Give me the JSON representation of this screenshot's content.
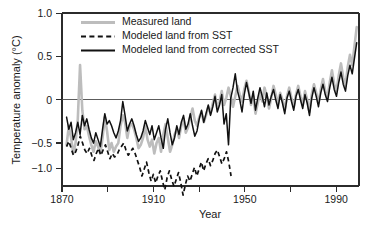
{
  "chart_data": {
    "type": "line",
    "title": "",
    "xlabel": "Year",
    "ylabel": "Temperature anomaly (°C)",
    "xlim": [
      1870,
      2000
    ],
    "ylim": [
      -1.25,
      1.0
    ],
    "grid": false,
    "legend_position": "top-left",
    "x_ticks_major": [
      1870,
      1910,
      1950,
      1990
    ],
    "x_ticks_minor": [
      1890,
      1930,
      1970
    ],
    "x_tick_labels": [
      "1870",
      "1910",
      "1950",
      "1990"
    ],
    "y_ticks": [
      1.0,
      0.5,
      0,
      -0.5,
      -1.0
    ],
    "y_tick_labels": [
      "1.0",
      "0.5",
      "0",
      "−0.5",
      "−1.0"
    ],
    "zero_reference_line": 0,
    "colors": {
      "measured": "#bdbdbd",
      "modeled_sst": "#111111",
      "modeled_corrected": "#111111",
      "axis": "#2b2b2b"
    },
    "series": [
      {
        "name": "Measured land",
        "style": "solid",
        "color": "#bdbdbd",
        "x_start": 1872,
        "x_end": 1999,
        "values": [
          -0.52,
          -0.3,
          -0.44,
          -0.62,
          -0.5,
          -0.22,
          0.4,
          -0.12,
          -0.34,
          -0.3,
          -0.42,
          -0.52,
          -0.6,
          -0.48,
          -0.54,
          -0.62,
          -0.44,
          -0.2,
          -0.36,
          -0.58,
          -0.5,
          -0.6,
          -0.54,
          -0.5,
          -0.3,
          -0.18,
          -0.26,
          -0.44,
          -0.3,
          -0.28,
          -0.34,
          -0.44,
          -0.56,
          -0.52,
          -0.44,
          -0.3,
          -0.46,
          -0.54,
          -0.46,
          -0.62,
          -0.5,
          -0.44,
          -0.6,
          -0.4,
          -0.28,
          -0.44,
          -0.6,
          -0.52,
          -0.4,
          -0.34,
          -0.44,
          -0.3,
          -0.22,
          -0.38,
          -0.32,
          -0.2,
          -0.1,
          -0.24,
          -0.3,
          -0.2,
          -0.14,
          -0.26,
          -0.18,
          -0.08,
          -0.16,
          -0.04,
          0.06,
          -0.1,
          -0.02,
          0.1,
          -0.06,
          0.02,
          0.14,
          0.04,
          -0.08,
          0.04,
          0.16,
          0.06,
          -0.02,
          0.12,
          0.22,
          0.1,
          -0.06,
          0.04,
          -0.16,
          -0.04,
          0.08,
          -0.02,
          0.14,
          0.04,
          -0.1,
          0.02,
          0.16,
          0.06,
          -0.04,
          0.08,
          0.0,
          -0.12,
          0.04,
          0.14,
          0.02,
          -0.08,
          0.06,
          0.16,
          0.04,
          -0.06,
          0.1,
          0.0,
          -0.14,
          0.06,
          0.18,
          0.08,
          -0.04,
          0.12,
          0.24,
          0.1,
          0.02,
          0.2,
          0.34,
          0.18,
          0.1,
          0.28,
          0.42,
          0.26,
          0.16,
          0.38,
          0.52,
          0.4,
          0.62,
          0.84
        ]
      },
      {
        "name": "Modeled land from SST",
        "style": "dashed",
        "color": "#111111",
        "x_start": 1872,
        "x_end": 1944,
        "values": [
          -0.54,
          -0.48,
          -0.56,
          -0.64,
          -0.6,
          -0.52,
          -0.42,
          -0.5,
          -0.58,
          -0.62,
          -0.56,
          -0.64,
          -0.7,
          -0.62,
          -0.56,
          -0.64,
          -0.58,
          -0.52,
          -0.6,
          -0.68,
          -0.62,
          -0.66,
          -0.64,
          -0.58,
          -0.54,
          -0.5,
          -0.58,
          -0.64,
          -0.6,
          -0.56,
          -0.62,
          -0.7,
          -0.78,
          -0.88,
          -0.8,
          -0.72,
          -0.84,
          -0.94,
          -0.86,
          -0.96,
          -0.88,
          -0.82,
          -0.94,
          -1.04,
          -0.9,
          -0.82,
          -0.92,
          -1.0,
          -0.92,
          -0.84,
          -0.96,
          -1.1,
          -0.98,
          -0.88,
          -0.94,
          -0.86,
          -0.78,
          -0.88,
          -0.8,
          -0.72,
          -0.82,
          -0.74,
          -0.68,
          -0.76,
          -0.7,
          -0.62,
          -0.58,
          -0.66,
          -0.74,
          -0.68,
          -0.6,
          -0.72,
          -0.88
        ]
      },
      {
        "name": "Modeled land from corrected SST",
        "style": "solid",
        "color": "#111111",
        "x_start": 1872,
        "x_end": 1999,
        "values": [
          -0.2,
          -0.34,
          -0.26,
          -0.46,
          -0.38,
          -0.26,
          -0.4,
          -0.18,
          -0.3,
          -0.22,
          -0.34,
          -0.44,
          -0.5,
          -0.38,
          -0.46,
          -0.54,
          -0.34,
          -0.16,
          -0.28,
          -0.24,
          -0.3,
          -0.38,
          -0.44,
          -0.36,
          -0.24,
          -0.02,
          -0.18,
          -0.36,
          -0.28,
          -0.22,
          -0.3,
          -0.4,
          -0.48,
          -0.44,
          -0.36,
          -0.24,
          -0.32,
          -0.4,
          -0.3,
          -0.46,
          -0.38,
          -0.3,
          -0.44,
          -0.56,
          -0.34,
          -0.22,
          -0.38,
          -0.52,
          -0.44,
          -0.3,
          -0.4,
          -0.26,
          -0.18,
          -0.34,
          -0.28,
          -0.16,
          -0.3,
          -0.42,
          -0.36,
          -0.22,
          -0.12,
          -0.26,
          -0.16,
          -0.06,
          -0.18,
          -0.08,
          0.04,
          -0.14,
          -0.06,
          0.06,
          -0.28,
          -0.16,
          -0.52,
          0.02,
          0.14,
          0.3,
          0.1,
          0.0,
          -0.14,
          0.06,
          0.2,
          0.08,
          -0.04,
          0.1,
          -0.12,
          0.02,
          0.14,
          0.04,
          -0.08,
          0.08,
          -0.06,
          0.04,
          0.12,
          0.0,
          -0.1,
          0.06,
          -0.04,
          -0.16,
          0.02,
          0.1,
          -0.02,
          -0.12,
          0.04,
          0.12,
          0.0,
          -0.1,
          0.06,
          -0.04,
          -0.18,
          0.02,
          0.14,
          0.04,
          -0.08,
          0.08,
          0.18,
          0.06,
          -0.02,
          0.14,
          0.26,
          0.12,
          0.04,
          0.2,
          0.32,
          0.18,
          0.1,
          0.28,
          0.4,
          0.3,
          0.48,
          0.66
        ]
      }
    ]
  },
  "legend": {
    "items": [
      {
        "label": "Measured land",
        "style": "solid-gray"
      },
      {
        "label": "Modeled land from SST",
        "style": "dashed-black"
      },
      {
        "label": "Modeled land from corrected SST",
        "style": "solid-black"
      }
    ]
  },
  "axes": {
    "x_title": "Year",
    "y_title": "Temperature anomaly (°C)"
  }
}
